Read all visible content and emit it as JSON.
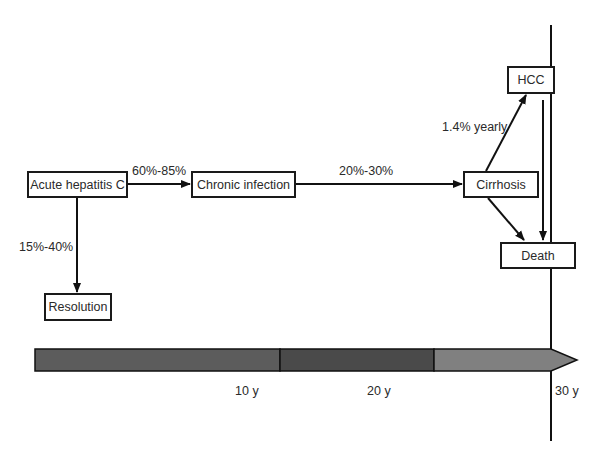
{
  "diagram": {
    "nodes": {
      "acute": "Acute hepatitis C",
      "chronic": "Chronic infection",
      "cirrhosis": "Cirrhosis",
      "hcc": "HCC",
      "death": "Death",
      "resolution": "Resolution"
    },
    "edges": {
      "acute_to_chronic": "60%-85%",
      "acute_to_resolution": "15%-40%",
      "chronic_to_cirrhosis": "20%-30%",
      "cirrhosis_to_hcc": "1.4% yearly"
    },
    "timeline": {
      "ticks": [
        "10 y",
        "20 y",
        "30 y"
      ],
      "segment_colors": [
        "#5c5c5c",
        "#4a4a4a",
        "#808080"
      ]
    }
  }
}
